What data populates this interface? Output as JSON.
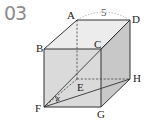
{
  "problem": {
    "number": "03"
  },
  "figure": {
    "type": "cube",
    "vertices": {
      "A": {
        "label": "A",
        "x": 77,
        "y": 20
      },
      "D": {
        "label": "D",
        "x": 130,
        "y": 20
      },
      "B": {
        "label": "B",
        "x": 44,
        "y": 49
      },
      "C": {
        "label": "C",
        "x": 101,
        "y": 49
      },
      "E": {
        "label": "E",
        "x": 77,
        "y": 79
      },
      "H": {
        "label": "H",
        "x": 130,
        "y": 79
      },
      "F": {
        "label": "F",
        "x": 44,
        "y": 107
      },
      "G": {
        "label": "G",
        "x": 101,
        "y": 107
      }
    },
    "edge_length_label": "5",
    "angle_label": "x",
    "colors": {
      "front_face": "#d9d9d9",
      "top_face": "#ececec",
      "right_face": "#c4c4c4",
      "edge": "#333333",
      "number": "#8c8c8c"
    }
  }
}
